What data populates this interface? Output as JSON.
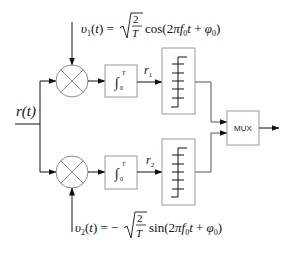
{
  "diagram": {
    "type": "quadrature correlator receiver block diagram",
    "input": {
      "label": "r(t)"
    },
    "branches": [
      {
        "id": "in-phase",
        "reference": {
          "lhs": "υ1(t)",
          "sign": "",
          "sqrt_num": "2",
          "sqrt_den": "T",
          "func": "cos",
          "arg": "(2πf0t + φ0)"
        },
        "multiplier": "⊗",
        "integrator": {
          "lower": "0",
          "upper": "T"
        },
        "output_label": "r1",
        "sampler": "sampler"
      },
      {
        "id": "quadrature",
        "reference": {
          "lhs": "υ2(t)",
          "sign": "−",
          "sqrt_num": "2",
          "sqrt_den": "T",
          "func": "sin",
          "arg": "(2πf0t + φ0)"
        },
        "multiplier": "⊗",
        "integrator": {
          "lower": "0",
          "upper": "T"
        },
        "output_label": "r2",
        "sampler": "sampler"
      }
    ],
    "mux": {
      "label": "MUX"
    },
    "colors": {
      "line": "#111111",
      "box": "#9a9a9a",
      "circle": "#8a8a8a"
    }
  }
}
